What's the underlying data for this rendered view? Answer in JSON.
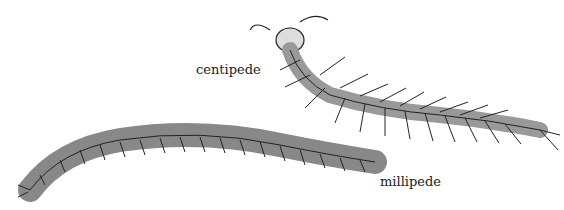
{
  "illustration": {
    "labels": {
      "centipede": "centipede",
      "millipede": "millipede"
    }
  }
}
